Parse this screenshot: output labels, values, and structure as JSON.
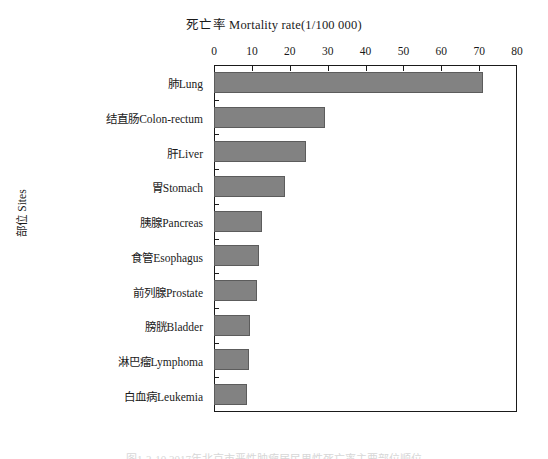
{
  "chart_data": {
    "type": "bar",
    "orientation": "horizontal",
    "title": "死亡率  Mortality rate(1/100 000)",
    "xlabel": "死亡率  Mortality rate(1/100 000)",
    "ylabel": "部位 Sites",
    "xlim": [
      0,
      80
    ],
    "xticks": [
      "0",
      "10",
      "20",
      "30",
      "40",
      "50",
      "60",
      "70",
      "80"
    ],
    "grid": false,
    "legend": null,
    "bar_color": "#828282",
    "bar_edge_color": "#5c5c5c",
    "categories": [
      "肺Lung",
      "结直肠Colon-rectum",
      "肝Liver",
      "胃Stomach",
      "胰腺Pancreas",
      "食管Esophagus",
      "前列腺Prostate",
      "膀胱Bladder",
      "淋巴瘤Lymphoma",
      "白血病Leukemia"
    ],
    "values": [
      71.0,
      29.3,
      24.3,
      18.7,
      12.6,
      11.8,
      11.3,
      9.5,
      9.2,
      8.7
    ]
  },
  "caption": {
    "text": "图1-2-10  2017年北京市恶性肿瘤居民男性死亡率主要部位顺位"
  }
}
